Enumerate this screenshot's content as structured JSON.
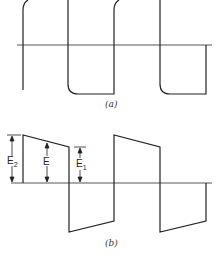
{
  "figure": {
    "panel_a": {
      "caption": "(a)",
      "description": "square wave with rounded corners (overshoot-free, finite rise time)"
    },
    "panel_b": {
      "caption": "(b)",
      "description": "square wave with tilt (droop)",
      "labels": {
        "e2": "E",
        "e2_sub": "2",
        "e": "E",
        "e1": "E",
        "e1_sub": "1"
      }
    },
    "colors": {
      "line": "#222222",
      "axis": "#444444",
      "background": "#ffffff"
    }
  }
}
